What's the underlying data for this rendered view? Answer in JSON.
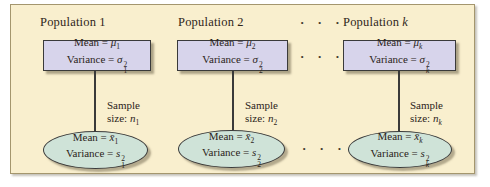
{
  "page": {
    "background": "#ffffff"
  },
  "panel": {
    "background": "#f9efce",
    "border_color": "#a4966e"
  },
  "colors": {
    "population_box_fill": "#d7d4eb",
    "sample_ellipse_fill": "#cfe3d8",
    "shape_border": "#3a3a3a",
    "text": "#2c241a",
    "shadow": "rgba(110,100,75,0.55)"
  },
  "dots": {
    "top": "· · ·",
    "middle": "· · ·",
    "bottom": "· · ·"
  },
  "populations": [
    {
      "title_prefix": "Population",
      "title_index": "1",
      "box": {
        "mean_label": "Mean = ",
        "mean_symbol": "μ",
        "mean_sub": "1",
        "variance_label": "Variance = ",
        "variance_symbol": "σ",
        "variance_sup": "2",
        "variance_sub": "1"
      },
      "sample": {
        "word1": "Sample",
        "word2": "size: ",
        "symbol": "n",
        "sub": "1"
      },
      "ellipse": {
        "mean_label": "Mean = ",
        "mean_symbol": "x̄",
        "mean_sub": "1",
        "variance_label": "Variance = ",
        "variance_symbol": "s",
        "variance_sup": "2",
        "variance_sub": "1"
      }
    },
    {
      "title_prefix": "Population",
      "title_index": "2",
      "box": {
        "mean_label": "Mean = ",
        "mean_symbol": "μ",
        "mean_sub": "2",
        "variance_label": "Variance = ",
        "variance_symbol": "σ",
        "variance_sup": "2",
        "variance_sub": "2"
      },
      "sample": {
        "word1": "Sample",
        "word2": "size: ",
        "symbol": "n",
        "sub": "2"
      },
      "ellipse": {
        "mean_label": "Mean = ",
        "mean_symbol": "x̄",
        "mean_sub": "2",
        "variance_label": "Variance = ",
        "variance_symbol": "s",
        "variance_sup": "2",
        "variance_sub": "2"
      }
    },
    {
      "title_prefix": "Population",
      "title_index": "k",
      "box": {
        "mean_label": "Mean = ",
        "mean_symbol": "μ",
        "mean_sub": "k",
        "variance_label": "Variance = ",
        "variance_symbol": "σ",
        "variance_sup": "2",
        "variance_sub": "k"
      },
      "sample": {
        "word1": "Sample",
        "word2": "size: ",
        "symbol": "n",
        "sub": "k"
      },
      "ellipse": {
        "mean_label": "Mean = ",
        "mean_symbol": "x̄",
        "mean_sub": "k",
        "variance_label": "Variance = ",
        "variance_symbol": "s",
        "variance_sup": "2",
        "variance_sub": "k"
      }
    }
  ]
}
